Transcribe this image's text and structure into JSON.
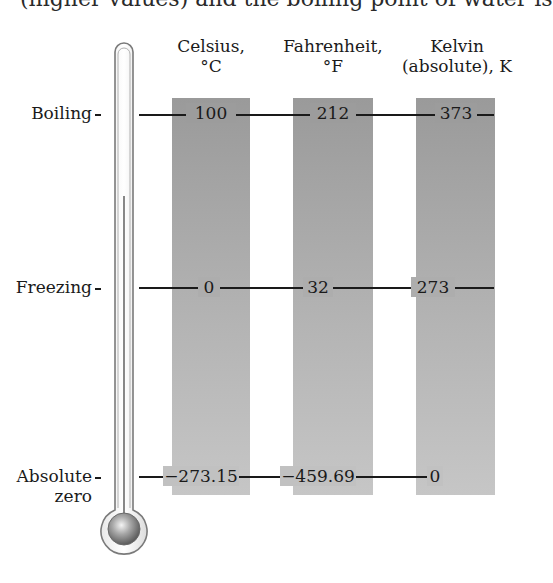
{
  "cutoff_text": "(higher values) and the boiling point of water is",
  "columns": [
    {
      "title_line1": "Celsius,",
      "title_line2": "°C"
    },
    {
      "title_line1": "Fahrenheit,",
      "title_line2": "°F"
    },
    {
      "title_line1": "Kelvin",
      "title_line2": "(absolute), K"
    }
  ],
  "rows": [
    {
      "label_line1": "Boiling",
      "label_line2": "",
      "values": [
        "100",
        "212",
        "373"
      ]
    },
    {
      "label_line1": "Freezing",
      "label_line2": "",
      "values": [
        "0",
        "32",
        "273"
      ]
    },
    {
      "label_line1": "Absolute",
      "label_line2": "zero",
      "values": [
        "−273.15",
        "−459.69",
        "0"
      ]
    }
  ],
  "colors": {
    "bar_top": "#9a9a9a",
    "bar_bottom": "#c6c6c6",
    "line": "#1a1a1a",
    "thermometer_outline": "#888888"
  },
  "icons": {
    "thermometer": "thermometer-icon"
  }
}
